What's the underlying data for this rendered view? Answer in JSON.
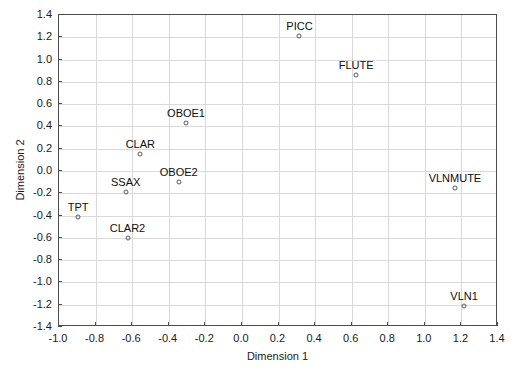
{
  "chart_data": {
    "type": "scatter",
    "title": "",
    "xlabel": "Dimension 1",
    "ylabel": "Dimension 2",
    "xlim": [
      -1.0,
      1.4
    ],
    "ylim": [
      -1.4,
      1.4
    ],
    "xticks": [
      "-1.0",
      "-0.8",
      "-0.6",
      "-0.4",
      "-0.2",
      "0.0",
      "0.2",
      "0.4",
      "0.6",
      "0.8",
      "1.0",
      "1.2",
      "1.4"
    ],
    "xtick_values": [
      -1.0,
      -0.8,
      -0.6,
      -0.4,
      -0.2,
      0.0,
      0.2,
      0.4,
      0.6,
      0.8,
      1.0,
      1.2,
      1.4
    ],
    "yticks": [
      "1.4",
      "1.2",
      "1.0",
      "0.8",
      "0.6",
      "0.4",
      "0.2",
      "0.0",
      "-0.2",
      "-0.4",
      "-0.6",
      "-0.8",
      "-1.0",
      "-1.2",
      "-1.4"
    ],
    "ytick_values": [
      1.4,
      1.2,
      1.0,
      0.8,
      0.6,
      0.4,
      0.2,
      0.0,
      -0.2,
      -0.4,
      -0.6,
      -0.8,
      -1.0,
      -1.2,
      -1.4
    ],
    "grid": true,
    "legend": null,
    "marker_style": "open-circle",
    "marker_color": "#595959",
    "grid_color": "#d9d9d9",
    "axis_color": "#4d4d4d",
    "points": [
      {
        "label": "PICC",
        "x": 0.32,
        "y": 1.2
      },
      {
        "label": "FLUTE",
        "x": 0.63,
        "y": 0.85
      },
      {
        "label": "OBOE1",
        "x": -0.3,
        "y": 0.42
      },
      {
        "label": "CLAR",
        "x": -0.55,
        "y": 0.14
      },
      {
        "label": "OBOE2",
        "x": -0.34,
        "y": -0.11
      },
      {
        "label": "SSAX",
        "x": -0.63,
        "y": -0.2
      },
      {
        "label": "VLNMUTE",
        "x": 1.17,
        "y": -0.16
      },
      {
        "label": "TPT",
        "x": -0.89,
        "y": -0.42
      },
      {
        "label": "CLAR2",
        "x": -0.62,
        "y": -0.61
      },
      {
        "label": "VLN1",
        "x": 1.22,
        "y": -1.22
      }
    ]
  }
}
